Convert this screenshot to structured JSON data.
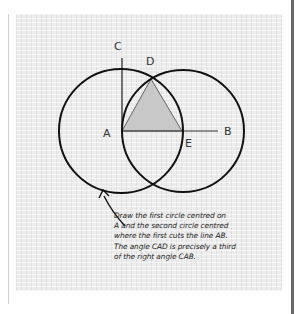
{
  "diagram": {
    "labels": {
      "A": "A",
      "B": "B",
      "C": "C",
      "D": "D",
      "E": "E"
    },
    "points": {
      "A": [
        122,
        131
      ],
      "B": [
        218,
        131
      ],
      "C": [
        122,
        58
      ],
      "D": [
        151,
        79
      ],
      "E": [
        182,
        131
      ]
    },
    "circles": [
      {
        "name": "first-circle",
        "center": "A",
        "cx": 121,
        "cy": 131,
        "r": 62
      },
      {
        "name": "second-circle",
        "center": "E",
        "cx": 183,
        "cy": 131,
        "r": 61
      }
    ],
    "shaded_triangle": [
      "A",
      "D",
      "E"
    ],
    "colors": {
      "paper": "#ececec",
      "stroke": "#111111",
      "triangle_fill": "#c8c8c8"
    }
  },
  "caption": {
    "lines": [
      "Draw the first circle centred on",
      "A and the second circle centred",
      "where the first cuts the line AB.",
      "The angle CAD is precisely a third",
      "of the right angle CAB."
    ]
  }
}
